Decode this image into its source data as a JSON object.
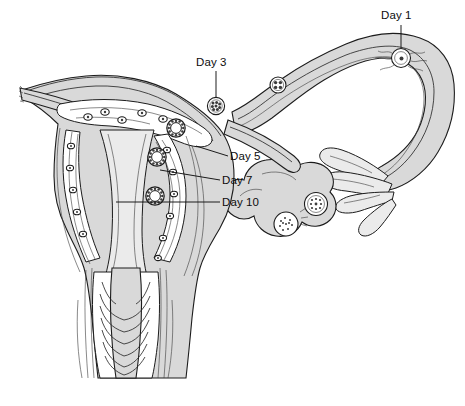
{
  "figure": {
    "background_color": "#ffffff",
    "ink_color": "#1c1c1c",
    "tissue_fill": "#d9d9d9",
    "lumen_fill": "#ffffff"
  },
  "labels": [
    {
      "id": "day1",
      "text": "Day 1",
      "x": 381,
      "y": 19,
      "anchor": "start",
      "stage": "fertilization of the ovum in the ampulla of the uterine tube",
      "leader": {
        "from_x": 401,
        "from_y": 25,
        "to_x": 401,
        "to_y": 52
      }
    },
    {
      "id": "day3",
      "text": "Day 3",
      "x": 196,
      "y": 66,
      "anchor": "start",
      "stage": "morula in the uterine tube",
      "leader": {
        "from_x": 216,
        "from_y": 71,
        "to_x": 216,
        "to_y": 100
      }
    },
    {
      "id": "day5",
      "text": "Day 5",
      "x": 230,
      "y": 160,
      "anchor": "start",
      "stage": "free blastocyst in the uterine cavity",
      "leader": {
        "from_x": 228,
        "from_y": 156,
        "to_x": 196,
        "to_y": 146
      }
    },
    {
      "id": "day7",
      "text": "Day 7",
      "x": 222,
      "y": 184,
      "anchor": "start",
      "stage": "blastocyst attaching to the endometrium",
      "leader": {
        "from_x": 220,
        "from_y": 180,
        "to_x": 160,
        "to_y": 172
      }
    },
    {
      "id": "day10",
      "text": "Day 10",
      "x": 222,
      "y": 206,
      "anchor": "start",
      "stage": "blastocyst implanted in the endometrium",
      "leader": {
        "from_x": 220,
        "from_y": 202,
        "to_x": 118,
        "to_y": 202
      }
    }
  ],
  "structures": {
    "uterus": "uterine body with myometrium and endometrium",
    "cervix": "cervical canal with plicae palmatae (arbor vitae)",
    "vagina": "upper vaginal canal",
    "left_tube": "left uterine (fallopian) tube, cut edge",
    "right_tube": "right uterine (fallopian) tube with ampulla and infundibulum",
    "ovary": "right ovary with developing follicles and corpus luteum",
    "fimbriae": "fimbriae of the infundibulum"
  },
  "embryos": [
    {
      "id": "zygote",
      "stage": "zygote with sperm",
      "x": 401,
      "y": 58,
      "r": 9.5,
      "type": "fertilized-ovum"
    },
    {
      "id": "cleavage-4cell",
      "stage": "cleavage 4-cell",
      "x": 278,
      "y": 85,
      "r": 8.0,
      "type": "cleavage"
    },
    {
      "id": "morula",
      "stage": "morula",
      "x": 216,
      "y": 106,
      "r": 8.5,
      "type": "morula"
    },
    {
      "id": "blastocyst-day5",
      "stage": "free blastocyst",
      "x": 176,
      "y": 128,
      "r": 9.0,
      "type": "blastocyst"
    },
    {
      "id": "blastocyst-day7",
      "stage": "attaching blastocyst",
      "x": 157,
      "y": 157,
      "r": 9.0,
      "type": "blastocyst"
    },
    {
      "id": "blastocyst-day10",
      "stage": "implanted blastocyst",
      "x": 155,
      "y": 196,
      "r": 9.0,
      "type": "blastocyst"
    }
  ],
  "ovary_contents": [
    {
      "id": "mature-follicle",
      "label": "mature graafian follicle",
      "x": 427,
      "y": 146,
      "r": 11
    },
    {
      "id": "corpus-luteum",
      "label": "corpus luteum",
      "x": 398,
      "y": 163,
      "r": 11
    }
  ]
}
